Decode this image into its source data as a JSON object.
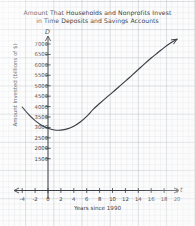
{
  "chart_data": {
    "type": "line",
    "title": "Amount That Households and Nonprofits Invest in Time Deposits and Savings Accounts",
    "title_line1": "Amount That Households and Nonprofits Invest",
    "title_line2": "in Time Deposits and Savings Accounts",
    "xlabel": "Years since 1990",
    "ylabel": "Amount Invested (billions of $)",
    "x_axis_name": "t",
    "y_axis_name": "D",
    "grid": true,
    "grid_style": "graph-paper",
    "legend": "none",
    "xlim": [
      -5,
      21
    ],
    "ylim": [
      0,
      7500
    ],
    "xticks": [
      "-4",
      "-2",
      "0",
      "2",
      "4",
      "6",
      "8",
      "10",
      "12",
      "14",
      "16",
      "18",
      "20"
    ],
    "xtick_values": [
      -4,
      -2,
      0,
      2,
      4,
      6,
      8,
      10,
      12,
      14,
      16,
      18,
      20
    ],
    "yticks": [
      "1500",
      "2000",
      "2500",
      "3000",
      "3500",
      "4000",
      "4500",
      "5000",
      "5500",
      "6000",
      "6500",
      "7000"
    ],
    "ytick_values": [
      1500,
      2000,
      2500,
      3000,
      3500,
      4000,
      4500,
      5000,
      5500,
      6000,
      6500,
      7000
    ],
    "series": [
      {
        "name": "D(t)",
        "color": "#3a3d44",
        "arrow_end": true,
        "x": [
          -4,
          -3,
          -2,
          -1,
          0,
          1,
          2,
          3,
          4,
          5,
          6,
          7,
          8,
          9,
          10,
          11,
          12,
          13,
          14,
          15,
          16,
          17,
          18,
          19,
          20
        ],
        "values": [
          3980,
          3620,
          3330,
          3110,
          2960,
          2880,
          2870,
          2930,
          3060,
          3260,
          3530,
          3870,
          4150,
          4420,
          4680,
          4950,
          5220,
          5500,
          5780,
          6060,
          6330,
          6580,
          6830,
          7050,
          7230
        ]
      }
    ],
    "annotations": {
      "minimum_approx_t": 1.5,
      "minimum_approx_value": 2870
    }
  }
}
